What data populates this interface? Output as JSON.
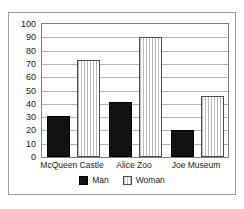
{
  "chart_data": {
    "type": "bar",
    "title": "",
    "subtitle": "",
    "xlabel": "",
    "ylabel": "",
    "categories": [
      "McQueen Castle",
      "Alice Zoo",
      "Joe Museum"
    ],
    "series": [
      {
        "name": "Man",
        "values": [
          31,
          41,
          20
        ],
        "color": "#121212",
        "fill": "solid"
      },
      {
        "name": "Woman",
        "values": [
          73,
          90,
          46
        ],
        "color": "#ffffff",
        "fill": "vertical-stripes"
      }
    ],
    "ylim": [
      0,
      100
    ],
    "ytick_step": 10,
    "ytick_labels": [
      "0",
      "10",
      "20",
      "30",
      "40",
      "50",
      "60",
      "70",
      "80",
      "90",
      "100"
    ],
    "grid": "horizontal",
    "legend_position": "bottom-center",
    "legend_entries": [
      "Man",
      "Woman"
    ],
    "annotations": []
  },
  "colors": {
    "frame": "#9a9a9a",
    "axis": "#808080",
    "gridline": "#b4b4b4",
    "text": "#1a1a1a",
    "plot_background": "#ffffff"
  }
}
